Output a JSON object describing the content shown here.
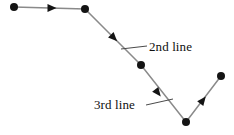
{
  "figure": {
    "type": "annotated-polyline-diagram",
    "width": 234,
    "height": 135,
    "background_color": "#ffffff",
    "line_color": "#8a8a8a",
    "marker_color": "#141414",
    "leader_color": "#4a4a4a",
    "text_color": "#101010"
  },
  "labels": {
    "second_line": "2nd line",
    "third_line": "3rd line"
  },
  "chart_data": {
    "type": "line",
    "title": "",
    "xlabel": "",
    "ylabel": "",
    "grid": false,
    "legend": "none",
    "xlim": [
      0,
      234
    ],
    "ylim": [
      135,
      0
    ],
    "note": "Directed polyline drawn in pixel coordinates; y increases downward.",
    "series": [
      {
        "name": "directed-polyline",
        "points": [
          {
            "x": 14,
            "y": 7
          },
          {
            "x": 85,
            "y": 9
          },
          {
            "x": 141,
            "y": 65
          },
          {
            "x": 186,
            "y": 122
          },
          {
            "x": 221,
            "y": 76
          }
        ]
      }
    ],
    "vertex_markers": [
      {
        "index": 0,
        "x": 14,
        "y": 7,
        "r": 4
      },
      {
        "index": 1,
        "x": 85,
        "y": 9,
        "r": 4
      },
      {
        "index": 2,
        "x": 141,
        "y": 65,
        "r": 4
      },
      {
        "index": 3,
        "x": 186,
        "y": 122,
        "r": 4
      },
      {
        "index": 4,
        "x": 221,
        "y": 76,
        "r": 4
      }
    ],
    "direction_arrows": [
      {
        "on_segment": 1,
        "x": 52,
        "y": 8,
        "angle_deg": 0,
        "label": "1st line"
      },
      {
        "on_segment": 2,
        "x": 114,
        "y": 38,
        "angle_deg": 45,
        "label": "2nd line"
      },
      {
        "on_segment": 3,
        "x": 158,
        "y": 93,
        "angle_deg": 52,
        "label": "3rd line"
      },
      {
        "on_segment": 4,
        "x": 203,
        "y": 100,
        "angle_deg": -52,
        "label": "4th line"
      }
    ],
    "annotations": [
      {
        "text": "2nd line",
        "text_x": 149,
        "text_y": 46,
        "leader_from_x": 147,
        "leader_from_y": 46,
        "leader_to_x": 121,
        "leader_to_y": 49
      },
      {
        "text": "3rd line",
        "text_x": 145,
        "text_y": 105,
        "leader_from_x": 146,
        "leader_from_y": 105,
        "leader_to_x": 173,
        "leader_to_y": 99
      }
    ]
  }
}
